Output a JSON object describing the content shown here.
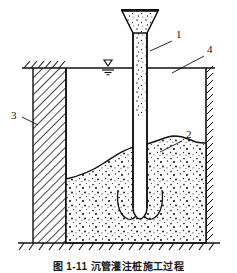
{
  "figure": {
    "caption": "图 1-11  沉管灌注桩施工过程",
    "background_color": "#ffffff",
    "line_color": "#111111"
  },
  "labels": [
    {
      "id": "1",
      "text": "1",
      "x": 176,
      "y": 38,
      "target": "funnel-pipe",
      "leader_from": [
        172,
        41
      ],
      "leader_to": [
        150,
        51
      ]
    },
    {
      "id": "2",
      "text": "2",
      "x": 186,
      "y": 138,
      "target": "sand-surface",
      "leader_from": [
        182,
        141
      ],
      "leader_to": [
        160,
        152
      ]
    },
    {
      "id": "3",
      "text": "3",
      "x": 14,
      "y": 119,
      "target": "hatched-soil-column",
      "leader_from": [
        22,
        117
      ],
      "leader_to": [
        38,
        125
      ]
    },
    {
      "id": "4",
      "text": "4",
      "x": 207,
      "y": 53,
      "target": "water-surface-line",
      "leader_from": [
        204,
        56
      ],
      "leader_to": [
        172,
        73
      ]
    }
  ],
  "elements": {
    "funnel": {
      "name": "hopper-funnel",
      "fill": "stipple-sand"
    },
    "pipe": {
      "name": "driven-casing-pipe",
      "fill_top": "stipple-sand",
      "fill_bottom": "empty"
    },
    "water_symbol": {
      "name": "water-level-symbol",
      "glyph": "triangle-down"
    },
    "water_line": {
      "name": "water-surface-line"
    },
    "sand_body": {
      "name": "sand-fill-body",
      "fill": "stipple-sand"
    },
    "left_column": {
      "name": "hatched-soil-column",
      "fill": "diagonal-hatch"
    },
    "right_wall": {
      "name": "right-wall-hatch-ticks"
    },
    "ground_line": {
      "name": "ground-base-line"
    },
    "scour_curves": {
      "name": "scour-flow-curves",
      "count": 2
    }
  }
}
